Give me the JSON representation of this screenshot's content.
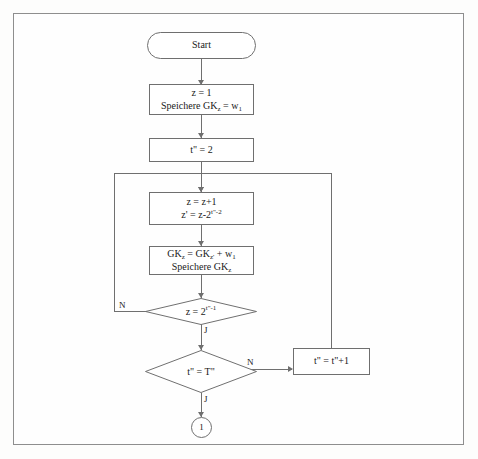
{
  "diagram": {
    "type": "flowchart",
    "title": "",
    "language": "de",
    "border_color": "#8e8e8e",
    "node_stroke_color": "#6f6f6f",
    "background_color": "#fdfdfc",
    "text_color": "#1a1a1a"
  },
  "nodes": {
    "start": {
      "shape": "terminator",
      "label": "Start"
    },
    "init": {
      "shape": "process",
      "line1": "z = 1",
      "line2_prefix": "Speichere GK",
      "line2_sub": "z",
      "line2_mid": " = w",
      "line2_sub2": "1"
    },
    "set_t": {
      "shape": "process",
      "var": "t",
      "prime": "\"",
      "eq": " = 2"
    },
    "increment": {
      "shape": "process",
      "line1": "z = z+1",
      "line2_lead": "z' = z-2",
      "line2_exp_var": "t",
      "line2_exp_prime": "\"",
      "line2_exp_rest": "-2"
    },
    "accumulate": {
      "shape": "process",
      "line1_a": "GK",
      "line1_sub_a": "z",
      "line1_b": " = GK",
      "line1_sub_b": "z'",
      "line1_c": " + w",
      "line1_sub_c": "1",
      "line2_a": "Speichere GK",
      "line2_sub": "z"
    },
    "decision_z": {
      "shape": "decision",
      "lead": "z = 2",
      "exp_var": "t",
      "exp_prime": "\"",
      "exp_rest": "-1",
      "label_no": "N",
      "label_yes": "J"
    },
    "decision_t": {
      "shape": "decision",
      "lead": "t\" = T\"",
      "label_no": "N",
      "label_yes": "J"
    },
    "increment_t": {
      "shape": "process",
      "label": "t\" = t\"+1"
    },
    "connector": {
      "shape": "circle",
      "label": "1"
    }
  }
}
